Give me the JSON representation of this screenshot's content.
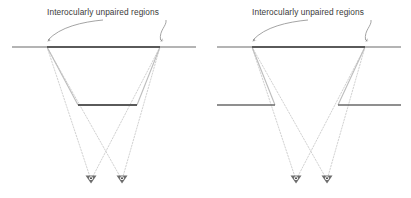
{
  "figure": {
    "type": "stereo-vision-occlusion-diagram",
    "background_color": "#ffffff",
    "width": 411,
    "height": 198,
    "panel_count": 2
  },
  "colors": {
    "bar_dark": "#5a5a5a",
    "bar_light": "#b4b4b4",
    "ray_solid": "#bdbdbd",
    "ray_dotted": "#c9c9c9",
    "leader_line": "#9a9a9a",
    "text": "#3a3a3a",
    "eye_fill": "#4a4a4a"
  },
  "panels": [
    {
      "id": "left",
      "name": "left-panel",
      "caption": "Interocularly unpaired regions",
      "near_surface": {
        "name": "near-occluding-bar",
        "x1": 12,
        "x2": 196,
        "y": 47,
        "dark_x1": 47,
        "dark_x2": 160
      },
      "far_surface": {
        "name": "far-surface-bar",
        "segments": [
          {
            "x1": 78,
            "x2": 137,
            "y": 105
          }
        ]
      },
      "eyes": [
        {
          "name": "left-eye",
          "x": 91,
          "y": 180
        },
        {
          "name": "right-eye",
          "x": 122,
          "y": 180
        }
      ],
      "solid_rays": [
        {
          "x1": 47,
          "y1": 47,
          "x2": 78,
          "y2": 105
        },
        {
          "x1": 160,
          "y1": 47,
          "x2": 137,
          "y2": 105
        }
      ],
      "dotted_rays": [
        {
          "x1": 47,
          "y1": 47,
          "x2": 91,
          "y2": 180
        },
        {
          "x1": 47,
          "y1": 47,
          "x2": 122,
          "y2": 180
        },
        {
          "x1": 160,
          "y1": 47,
          "x2": 91,
          "y2": 180
        },
        {
          "x1": 160,
          "y1": 47,
          "x2": 122,
          "y2": 180
        }
      ],
      "leaders": [
        {
          "name": "left-leader-arrow",
          "tip_x": 47,
          "tip_y": 42
        },
        {
          "name": "right-leader-arrow",
          "tip_x": 160,
          "tip_y": 42
        }
      ]
    },
    {
      "id": "right",
      "name": "right-panel",
      "caption": "Interocularly unpaired regions",
      "near_surface": {
        "name": "near-occluding-bar",
        "x1": 12,
        "x2": 196,
        "y": 47,
        "dark_x1": 47,
        "dark_x2": 160
      },
      "far_surface": {
        "name": "far-surface-bar",
        "segments": [
          {
            "x1": 12,
            "x2": 70,
            "y": 105
          },
          {
            "x1": 133,
            "x2": 196,
            "y": 105
          }
        ]
      },
      "eyes": [
        {
          "name": "left-eye",
          "x": 91,
          "y": 180
        },
        {
          "name": "right-eye",
          "x": 122,
          "y": 180
        }
      ],
      "solid_rays": [
        {
          "x1": 47,
          "y1": 47,
          "x2": 70,
          "y2": 105
        },
        {
          "x1": 160,
          "y1": 47,
          "x2": 133,
          "y2": 105
        }
      ],
      "dotted_rays": [
        {
          "x1": 47,
          "y1": 47,
          "x2": 91,
          "y2": 180
        },
        {
          "x1": 47,
          "y1": 47,
          "x2": 122,
          "y2": 180
        },
        {
          "x1": 160,
          "y1": 47,
          "x2": 91,
          "y2": 180
        },
        {
          "x1": 160,
          "y1": 47,
          "x2": 122,
          "y2": 180
        }
      ],
      "leaders": [
        {
          "name": "left-leader-arrow",
          "tip_x": 47,
          "tip_y": 42
        },
        {
          "name": "right-leader-arrow",
          "tip_x": 160,
          "tip_y": 42
        }
      ]
    }
  ]
}
